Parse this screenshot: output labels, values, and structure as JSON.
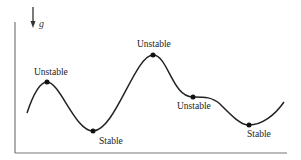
{
  "diagram": {
    "axis_symbol": "g",
    "gravity_arrow": "down",
    "colors": {
      "axis": "#777777",
      "curve": "#222222",
      "points": "#111111",
      "text": "#222222"
    },
    "points": [
      {
        "label": "Unstable",
        "type": "local-maximum"
      },
      {
        "label": "Stable",
        "type": "local-minimum"
      },
      {
        "label": "Unstable",
        "type": "global-maximum"
      },
      {
        "label": "Unstable",
        "type": "inflection-plateau"
      },
      {
        "label": "Stable",
        "type": "global-minimum"
      }
    ]
  }
}
